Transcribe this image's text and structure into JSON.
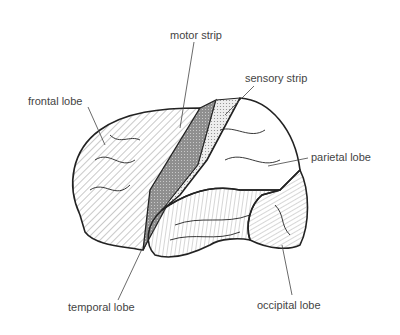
{
  "diagram": {
    "labels": {
      "motor_strip": "motor strip",
      "sensory_strip": "sensory strip",
      "frontal_lobe": "frontal lobe",
      "parietal_lobe": "parietal lobe",
      "temporal_lobe": "temporal lobe",
      "occipital_lobe": "occipital lobe"
    },
    "colors": {
      "outline": "#222222",
      "motor_fill": "#9a9a9a",
      "sensory_fill": "#d8d8d8",
      "text": "#444444"
    }
  }
}
